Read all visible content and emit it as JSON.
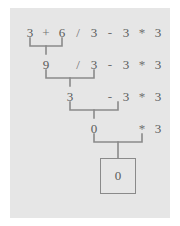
{
  "panel": {
    "background_color": "#e6e6e6",
    "page_background_color": "#ffffff",
    "text_color": "#5a5a5a",
    "line_color": "#8a8a8a"
  },
  "diagram": {
    "expression": "3 + 6 / 3 - 3 * 3",
    "final_result": "0",
    "rows": [
      {
        "index": 0,
        "tokens": [
          "3",
          "+",
          "6",
          "/",
          "3",
          "-",
          "3",
          "*",
          "3"
        ],
        "reduced_pair": "3 + 6",
        "produces": "9"
      },
      {
        "index": 1,
        "tokens": [
          "9",
          "/",
          "3",
          "-",
          "3",
          "*",
          "3"
        ],
        "reduced_pair": "9 / 3",
        "produces": "3"
      },
      {
        "index": 2,
        "tokens": [
          "3",
          "-",
          "3",
          "*",
          "3"
        ],
        "reduced_pair": "3 - 3",
        "produces": "0"
      },
      {
        "index": 3,
        "tokens": [
          "0",
          "*",
          "3"
        ],
        "reduced_pair": "0 * 3",
        "produces": "0"
      }
    ],
    "row0": {
      "t0": "3",
      "t1": "+",
      "t2": "6",
      "t3": "/",
      "t4": "3",
      "t5": "-",
      "t6": "3",
      "t7": "*",
      "t8": "3"
    },
    "row1": {
      "t0": "9",
      "t3": "/",
      "t4": "3",
      "t5": "-",
      "t6": "3",
      "t7": "*",
      "t8": "3"
    },
    "row2": {
      "t0": "3",
      "t5": "-",
      "t6": "3",
      "t7": "*",
      "t8": "3"
    },
    "row3": {
      "t0": "0",
      "t7": "*",
      "t8": "3"
    },
    "result": {
      "value": "0"
    }
  }
}
